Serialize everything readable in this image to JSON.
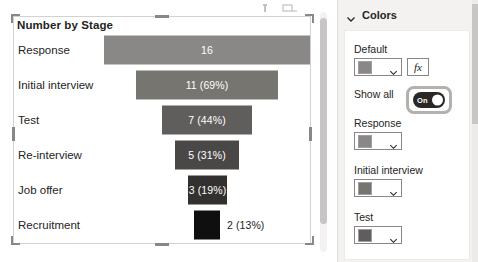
{
  "visual": {
    "title": "Number by Stage",
    "header_icons": [
      "filter-icon",
      "focus-mode-icon"
    ]
  },
  "chart_data": {
    "type": "bar",
    "subtype": "funnel",
    "title": "Number by Stage",
    "xlabel": "",
    "ylabel": "",
    "categories": [
      "Response",
      "Initial interview",
      "Test",
      "Re-interview",
      "Job offer",
      "Recruitment"
    ],
    "values": [
      16,
      11,
      7,
      5,
      3,
      2
    ],
    "data_labels": [
      "16",
      "11 (69%)",
      "7 (44%)",
      "5 (31%)",
      "3 (19%)",
      "2 (13%)"
    ],
    "percentages": [
      100,
      69,
      44,
      31,
      19,
      13
    ],
    "colors": [
      "#8a8886",
      "#77756f",
      "#605e5c",
      "#4a4846",
      "#333130",
      "#100f0f"
    ],
    "label_positions": [
      "inside",
      "inside",
      "inside",
      "inside",
      "inside",
      "outside"
    ],
    "grid": false,
    "legend": "none"
  },
  "pane": {
    "header": "Colors",
    "default": {
      "label": "Default",
      "swatch_color": "#8a8886",
      "fx_label": "fx"
    },
    "show_all": {
      "label": "Show all",
      "state": "On"
    },
    "items": [
      {
        "label": "Response",
        "swatch_color": "#8a8886"
      },
      {
        "label": "Initial interview",
        "swatch_color": "#77756f"
      },
      {
        "label": "Test",
        "swatch_color": "#605e5c"
      }
    ]
  }
}
